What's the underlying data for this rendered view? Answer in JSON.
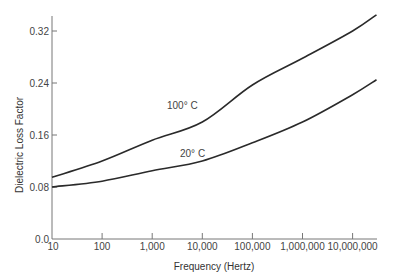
{
  "chart_data": {
    "type": "line",
    "title": "",
    "xlabel": "Frequency (Hertz)",
    "ylabel": "Dielectric Loss Factor",
    "xscale": "log",
    "x_tick_labels": [
      "10",
      "100",
      "1,000",
      "10,000",
      "100,000",
      "1,000,000",
      "10,000,000"
    ],
    "x_ticks": [
      10,
      100,
      1000,
      10000,
      100000,
      1000000,
      10000000
    ],
    "y_tick_labels": [
      "0.0",
      "0.08",
      "0.16",
      "0.24",
      "0.32"
    ],
    "y_ticks": [
      0.0,
      0.08,
      0.16,
      0.24,
      0.32
    ],
    "xlim": [
      10,
      30000000
    ],
    "ylim": [
      0.0,
      0.35
    ],
    "grid": false,
    "legend": "none (inline curve labels)",
    "x": [
      10,
      100,
      1000,
      10000,
      100000,
      1000000,
      10000000,
      30000000
    ],
    "series": [
      {
        "name": "100° C",
        "values": [
          0.095,
          0.12,
          0.152,
          0.18,
          0.237,
          0.278,
          0.32,
          0.345
        ],
        "label_position": {
          "x": 1500,
          "y": 0.205
        }
      },
      {
        "name": "20° C",
        "values": [
          0.08,
          0.089,
          0.105,
          0.12,
          0.148,
          0.18,
          0.222,
          0.245
        ],
        "label_position": {
          "x": 5000,
          "y": 0.135
        }
      }
    ],
    "annotations": [
      "100° C",
      "20° C"
    ]
  },
  "labels": {
    "curve_100": "100° C",
    "curve_20": "20° C",
    "xlabel": "Frequency (Hertz)",
    "ylabel": "Dielectric Loss Factor"
  }
}
